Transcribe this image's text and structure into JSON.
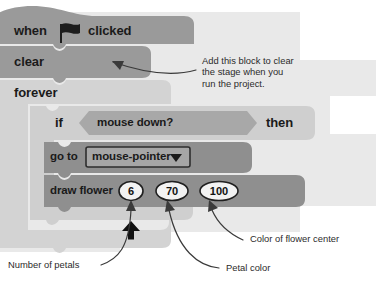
{
  "page": {
    "background": "#ffffff",
    "canvas_background": "#e9e9e9"
  },
  "palette": {
    "page_bg": "#ffffff",
    "canvas_bg": "#e9e9e9",
    "hat_block": "#9a9a9a",
    "clear_block": "#9a9a9a",
    "forever_block": "#d3d3d3",
    "if_block": "#cfcfcf",
    "boolean_block": "#a8a8a8",
    "inner_block": "#8f8f8f",
    "oval_fill": "#f2f2f2",
    "text_dark": "#1a1a1a",
    "annotation_text": "#2b2b2b",
    "arrow_stroke": "#3a3a3a"
  },
  "script": {
    "blocks": [
      {
        "id": "when-flag-clicked",
        "type": "hat",
        "text_before": "when",
        "icon": "green-flag-icon",
        "text_after": "clicked"
      },
      {
        "id": "clear",
        "type": "stack",
        "label": "clear"
      },
      {
        "id": "forever",
        "type": "c-block",
        "label": "forever",
        "loop_icon": "loop-arrow-icon"
      },
      {
        "id": "if-then",
        "type": "c-block",
        "label_if": "if",
        "label_then": "then",
        "condition": {
          "id": "mouse-down",
          "type": "boolean",
          "label": "mouse down?"
        }
      },
      {
        "id": "go-to",
        "type": "stack",
        "label": "go to",
        "dropdown": {
          "value": "mouse-pointer",
          "icon": "chevron-down-icon"
        }
      },
      {
        "id": "draw-flower",
        "type": "stack",
        "label": "draw flower",
        "inputs": [
          {
            "name": "petal-count",
            "value": "6"
          },
          {
            "name": "petal-color",
            "value": "70"
          },
          {
            "name": "center-color",
            "value": "100"
          }
        ]
      }
    ]
  },
  "annotations": [
    {
      "id": "clear-note",
      "lines": [
        "Add this block to clear",
        "the stage when you",
        "run the project."
      ],
      "points_to": "clear"
    },
    {
      "id": "petal-count-note",
      "lines": [
        "Number of petals"
      ],
      "points_to": "petal-count"
    },
    {
      "id": "petal-color-note",
      "lines": [
        "Petal color"
      ],
      "points_to": "petal-color"
    },
    {
      "id": "center-color-note",
      "lines": [
        "Color of flower center"
      ],
      "points_to": "center-color"
    }
  ]
}
